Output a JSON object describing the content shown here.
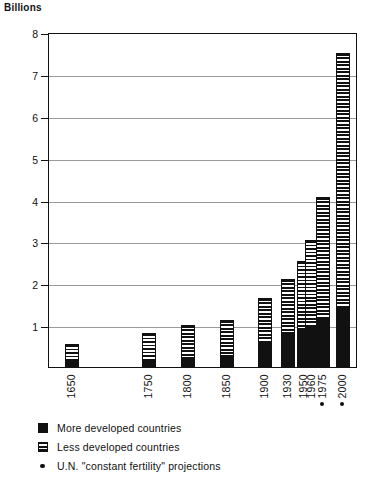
{
  "chart_data": {
    "type": "bar",
    "title": "",
    "ylabel": "Billions",
    "xlabel": "",
    "ylim": [
      0,
      8
    ],
    "yticks": [
      1,
      2,
      3,
      4,
      5,
      6,
      7,
      8
    ],
    "grid": true,
    "stacked": true,
    "xscale": "linear-time",
    "xlim": [
      1620,
      2020
    ],
    "categories": [
      "1650",
      "1750",
      "1800",
      "1850",
      "1900",
      "1930",
      "1950",
      "1960",
      "1975",
      "2000"
    ],
    "series": [
      {
        "name": "More developed countries",
        "pattern": "solid-black",
        "values": [
          0.11,
          0.15,
          0.2,
          0.27,
          0.55,
          0.76,
          0.86,
          0.98,
          1.13,
          1.44
        ]
      },
      {
        "name": "Less developed countries",
        "pattern": "horizontal-hatch",
        "values": [
          0.44,
          0.66,
          0.8,
          0.85,
          1.1,
          1.34,
          1.67,
          2.05,
          2.92,
          6.06
        ]
      }
    ],
    "totals": [
      0.55,
      0.81,
      1.0,
      1.12,
      1.65,
      2.1,
      2.53,
      3.03,
      4.05,
      7.5
    ],
    "annotations": [
      {
        "label": "U.N. \"constant fertility\" projections",
        "marker": "dot",
        "at": [
          "1975",
          "2000"
        ]
      }
    ],
    "legend": {
      "position": "below-axis",
      "entries": [
        {
          "label": "More developed countries",
          "swatch": "solid-black"
        },
        {
          "label": "Less developed countries",
          "swatch": "horizontal-hatch"
        },
        {
          "label": "U.N. \"constant fertility\" projections",
          "swatch": "dot"
        }
      ]
    }
  },
  "colors": {
    "ink": "#111111",
    "grid": "#9a9a9a",
    "background": "#ffffff"
  }
}
